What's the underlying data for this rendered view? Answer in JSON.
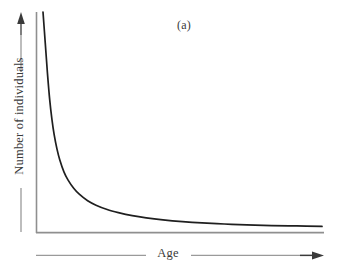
{
  "figure": {
    "panel_label": "(a)",
    "background_color": "#ffffff",
    "axis_color": "#8a8a8a",
    "curve_color": "#1f1f1f",
    "text_color": "#3a3a3a"
  },
  "chart_data": {
    "type": "line",
    "title": "(a)",
    "subtitle": "",
    "xlabel": "Age",
    "ylabel": "Number of individuals",
    "grid": false,
    "legend": "none",
    "axis_ticks": {
      "x": [],
      "y": []
    },
    "xlim": [
      0,
      100
    ],
    "ylim": [
      0,
      100
    ],
    "annotations": [
      {
        "text": "(a)",
        "x": 58,
        "y": 95
      }
    ],
    "series": [
      {
        "name": "Type III survivorship",
        "description": "Steeply decaying curve: very high early mortality, long flat tail approaching but never reaching zero",
        "x": [
          0.0,
          0.8,
          1.6,
          2.4,
          3.2,
          4.0,
          5.0,
          6.0,
          7.5,
          9.0,
          11.0,
          13.0,
          16.0,
          19.0,
          23.0,
          27.0,
          32.0,
          37.0,
          43.0,
          50.0,
          57.0,
          65.0,
          73.0,
          82.0,
          91.0,
          100.0
        ],
        "y": [
          100.0,
          86.0,
          72.0,
          60.0,
          51.0,
          44.0,
          37.5,
          32.5,
          27.0,
          23.2,
          19.5,
          16.8,
          13.8,
          11.8,
          9.8,
          8.4,
          7.0,
          6.0,
          5.1,
          4.3,
          3.7,
          3.2,
          2.8,
          2.5,
          2.3,
          2.1
        ]
      }
    ]
  },
  "axis_arrows": {
    "y_arrow_label": "increasing number of individuals",
    "x_arrow_label": "increasing age"
  }
}
